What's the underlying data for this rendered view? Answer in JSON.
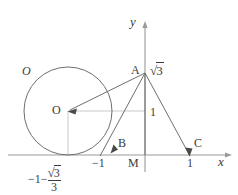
{
  "figure": {
    "background": "#ffffff",
    "stroke_color": "#6e6e6e",
    "axis_color": "#9a9a9a",
    "guide_color": "#c9c9c9",
    "text_color": "#3a3a3a",
    "axes": {
      "x_label": "x",
      "y_label": "y",
      "x_axis_y": 155,
      "y_axis_x": 145,
      "x_axis_from": 8,
      "x_axis_to": 232,
      "y_axis_from": 22,
      "y_axis_to": 172
    },
    "circle": {
      "name_label": "O",
      "center_label": "O",
      "cx": 68,
      "cy": 111,
      "r": 44
    },
    "points": [
      {
        "id": "A",
        "label": "A",
        "x": 145,
        "y": 73
      },
      {
        "id": "B",
        "label": "B",
        "x": 112,
        "y": 152
      },
      {
        "id": "C",
        "label": "C",
        "x": 190,
        "y": 155
      },
      {
        "id": "M",
        "label": "M",
        "x": 145,
        "y": 155
      },
      {
        "id": "O",
        "label": "O",
        "x": 68,
        "y": 111
      }
    ],
    "annotations": {
      "a_height": "√3",
      "a_height_sqrt_radicand": "3",
      "segment_am": "1",
      "tick_minus_one": "−1",
      "tick_one": "1",
      "tangent_point_x_num": "3",
      "tangent_point_x_den": "3",
      "tangent_point_x_lead": "−1−"
    }
  }
}
